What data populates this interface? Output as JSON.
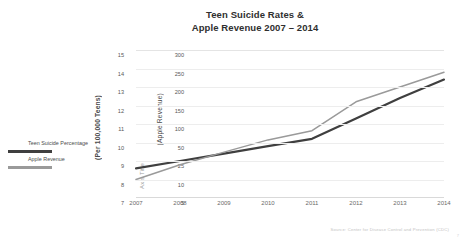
{
  "title": {
    "line1": "Teen Suicide Rates &",
    "line2": "Apple Revenue 2007 – 2014"
  },
  "axes": {
    "primary_title": "(Per 100,000 Teens)",
    "secondary_title": "(Apple Revenue)",
    "generic_title": "Axis Title"
  },
  "legend": {
    "items": [
      {
        "label": "Teen Suicide Percentage",
        "color": "#3f3f3f"
      },
      {
        "label": "Apple Revenue",
        "color": "#9a9a9a"
      }
    ]
  },
  "source": "Source: Center for Disease Control and Prevention (CDC)",
  "page_number": "7",
  "chart_data": {
    "type": "line",
    "title": "Teen Suicide Rates & Apple Revenue 2007 – 2014",
    "xlabel": "",
    "ylabel": "(Per 100,000 Teens)",
    "y2label": "(Apple Revenue)",
    "grid": true,
    "legend_position": "left",
    "categories": [
      "2007",
      "2008",
      "2009",
      "2010",
      "2011",
      "2012",
      "2013",
      "2014"
    ],
    "primary_ticks": [
      15,
      14,
      13,
      12,
      11,
      10,
      9,
      8,
      7
    ],
    "secondary_ticks": [
      300,
      250,
      200,
      150,
      100,
      50,
      25,
      10,
      5
    ],
    "ylim": [
      7,
      15
    ],
    "y2lim": [
      5,
      300
    ],
    "series": [
      {
        "name": "Teen Suicide Percentage",
        "axis": "primary",
        "color": "#3f3f3f",
        "values": [
          8.6,
          9.0,
          9.4,
          9.8,
          10.2,
          11.3,
          12.4,
          13.4
        ]
      },
      {
        "name": "Apple Revenue",
        "axis": "secondary",
        "color": "#9a9a9a",
        "values": [
          10,
          22,
          37,
          57,
          82,
          160,
          200,
          240
        ]
      }
    ]
  }
}
